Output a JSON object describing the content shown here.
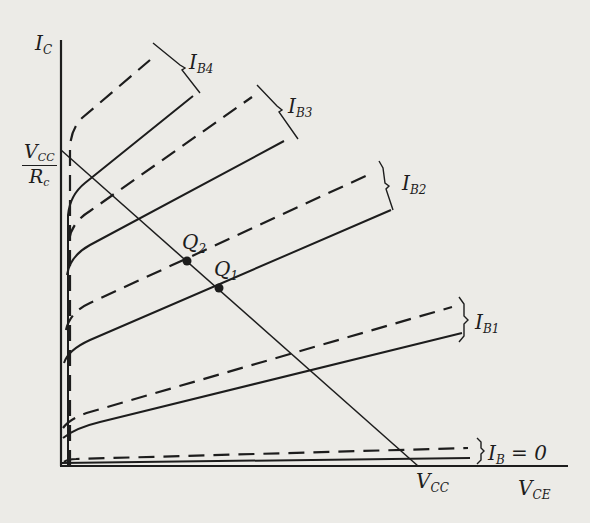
{
  "diagram": {
    "axes": {
      "y_label": {
        "main": "I",
        "sub": "C"
      },
      "x_label": {
        "main": "V",
        "sub": "CE"
      },
      "y_intercept_label": {
        "num_main": "V",
        "num_sub": "CC",
        "den_main": "R",
        "den_sub": "c"
      },
      "x_intercept_label": {
        "main": "V",
        "sub": "CC"
      }
    },
    "curve_families": [
      {
        "name": "IB4",
        "label": {
          "main": "I",
          "sub": "B4"
        }
      },
      {
        "name": "IB3",
        "label": {
          "main": "I",
          "sub": "B3"
        }
      },
      {
        "name": "IB2",
        "label": {
          "main": "I",
          "sub": "B2"
        }
      },
      {
        "name": "IB1",
        "label": {
          "main": "I",
          "sub": "B1"
        }
      },
      {
        "name": "IB0",
        "label": {
          "main": "I",
          "sub": "B",
          "suffix": " = 0"
        }
      }
    ],
    "operating_points": [
      {
        "name": "Q2",
        "label": {
          "main": "Q",
          "sub": "2"
        }
      },
      {
        "name": "Q1",
        "label": {
          "main": "Q",
          "sub": "1"
        }
      }
    ],
    "legend_note": "Each base-current family shows a solid and a dashed characteristic curve"
  }
}
